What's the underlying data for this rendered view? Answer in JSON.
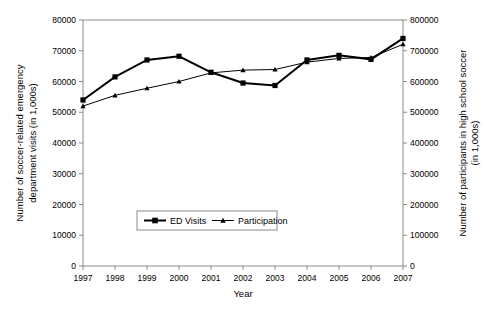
{
  "chart_data": {
    "type": "line",
    "title": "",
    "xlabel": "Year",
    "categories": [
      1997,
      1998,
      1999,
      2000,
      2001,
      2002,
      2003,
      2004,
      2005,
      2006,
      2007
    ],
    "x_tick_labels": [
      "1997",
      "1998",
      "1999",
      "2000",
      "2001",
      "2002",
      "2003",
      "2004",
      "2005",
      "2006",
      "2007"
    ],
    "grid": false,
    "legend_position": "inside-bottom-center",
    "axes": {
      "left": {
        "label": "Number of soccer-related emergency department visits (in 1,000s)",
        "label_line1": "Number of soccer-related emergency",
        "label_line2": "department visits (in 1,000s)",
        "ylim": [
          0,
          80000
        ],
        "tick_step": 10000,
        "tick_labels": [
          "0",
          "10000",
          "20000",
          "30000",
          "40000",
          "50000",
          "60000",
          "70000",
          "80000"
        ]
      },
      "right": {
        "label": "Number of participants in high school soccer (in 1,000s)",
        "label_line1": "Number of participants in high school soccer",
        "label_line2": "(in 1,000s)",
        "ylim": [
          0,
          800000
        ],
        "tick_step": 100000,
        "tick_labels": [
          "0",
          "100000",
          "200000",
          "300000",
          "400000",
          "500000",
          "600000",
          "700000",
          "800000"
        ]
      }
    },
    "series": [
      {
        "name": "ED Visits",
        "axis": "left",
        "marker": "square",
        "color": "#000000",
        "line_width": 2,
        "values": [
          54000,
          61500,
          67000,
          68200,
          63000,
          59500,
          58700,
          67000,
          68500,
          67200,
          74000
        ]
      },
      {
        "name": "Participation",
        "axis": "right",
        "marker": "triangle",
        "color": "#000000",
        "line_width": 1,
        "values": [
          520000,
          555000,
          578000,
          600000,
          628000,
          637000,
          639000,
          663000,
          675000,
          678000,
          721000
        ]
      }
    ]
  },
  "legend": {
    "entries": [
      {
        "label": "ED Visits",
        "marker": "square-marker-icon"
      },
      {
        "label": "Participation",
        "marker": "triangle-marker-icon"
      }
    ]
  }
}
